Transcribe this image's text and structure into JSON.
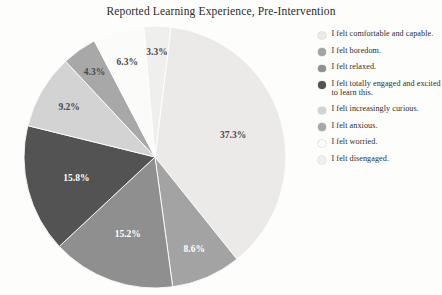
{
  "chart_data": {
    "type": "pie",
    "title": "Reported Learning Experience, Pre-Intervention",
    "xlabel": "",
    "ylabel": "",
    "legend_position": "right",
    "grid": false,
    "start_angle_deg": 7,
    "direction": "clockwise",
    "categories": [
      "I felt comfortable and capable.",
      "I felt boredom.",
      "I felt relaxed.",
      "I felt totally engaged and excited to learn this.",
      "I felt increasingly curious.",
      "I felt anxious.",
      "I felt worried.",
      "I felt disengaged."
    ],
    "values": [
      37.3,
      8.6,
      15.2,
      15.8,
      9.2,
      4.3,
      6.3,
      3.3
    ],
    "value_labels": [
      "37.3%",
      "8.6%",
      "15.2%",
      "15.8%",
      "9.2%",
      "4.3%",
      "6.3%",
      "3.3%"
    ],
    "colors": [
      "#eceae8",
      "#a3a3a3",
      "#8f8f8f",
      "#535353",
      "#d3d3d3",
      "#a8a8a8",
      "#fbfbfa",
      "#efefee"
    ],
    "label_text_colors": [
      "dark",
      "light",
      "light",
      "light",
      "dark",
      "dark",
      "dark",
      "dark"
    ]
  },
  "header": {
    "title": "Reported Learning Experience, Pre-Intervention"
  },
  "legend": {
    "items": [
      {
        "label": "I felt comfortable and capable.",
        "color": "#eceae8"
      },
      {
        "label": "I felt boredom.",
        "color": "#a3a3a3"
      },
      {
        "label": "I felt relaxed.",
        "color": "#8f8f8f"
      },
      {
        "label": "I felt totally engaged and excited to learn this.",
        "color": "#535353"
      },
      {
        "label": "I felt increasingly curious.",
        "color": "#d3d3d3"
      },
      {
        "label": "I felt anxious.",
        "color": "#a8a8a8"
      },
      {
        "label": "I felt worried.",
        "color": "#fbfbfa"
      },
      {
        "label": "I felt disengaged.",
        "color": "#efefee"
      }
    ]
  }
}
